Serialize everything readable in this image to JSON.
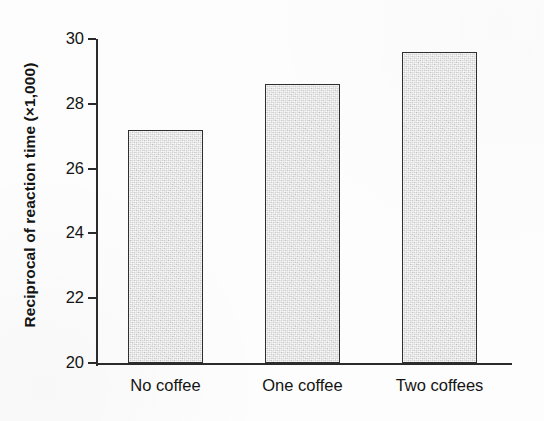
{
  "chart_data": {
    "type": "bar",
    "title": "",
    "subtitle": "",
    "xlabel": "",
    "ylabel": "Reciprocal of reaction time (×1,000)",
    "categories": [
      "No coffee",
      "One coffee",
      "Two coffees"
    ],
    "values": [
      27.2,
      28.6,
      29.6
    ],
    "ylim": [
      20,
      30
    ],
    "yticks": [
      20,
      22,
      24,
      26,
      28,
      30
    ],
    "ytick_labels": [
      "20",
      "22",
      "24",
      "26",
      "28",
      "30"
    ],
    "grid": false,
    "legend": null,
    "legend_position": "none",
    "annotations": [],
    "series": [
      {
        "name": "Reciprocal of reaction time",
        "values": [
          27.2,
          28.6,
          29.6
        ]
      }
    ],
    "colors": {
      "bar_fill": "#d9d9d9",
      "bar_edge": "#2f2f2f",
      "axis": "#2b2b2b",
      "text": "#141414",
      "background": "#fdfdfd"
    }
  },
  "axis": {
    "y_title": "Reciprocal of reaction time (×1,000)",
    "ticks": [
      {
        "label": "30",
        "value": 30
      },
      {
        "label": "28",
        "value": 28
      },
      {
        "label": "26",
        "value": 26
      },
      {
        "label": "24",
        "value": 24
      },
      {
        "label": "22",
        "value": 22
      },
      {
        "label": "20",
        "value": 20
      }
    ]
  },
  "bars": [
    {
      "label": "No coffee",
      "value": 27.2
    },
    {
      "label": "One coffee",
      "value": 28.6
    },
    {
      "label": "Two coffees",
      "value": 29.6
    }
  ]
}
